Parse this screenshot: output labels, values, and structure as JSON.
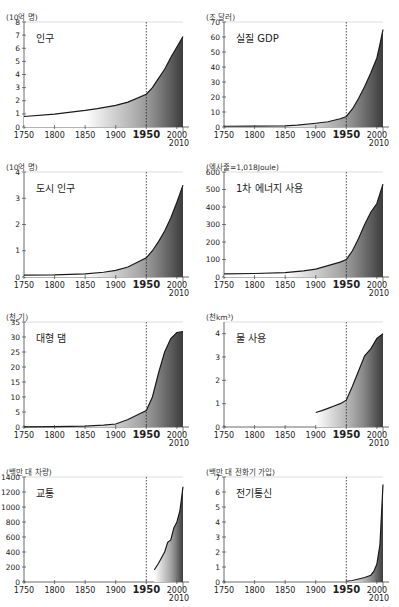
{
  "header_fragment": "",
  "chart_data": [
    {
      "type": "area",
      "title": "인구",
      "ylabel": "(10억 명)",
      "xlabel": "",
      "xlim": [
        1750,
        2010
      ],
      "ylim": [
        0,
        8
      ],
      "yticks": [
        0,
        1,
        2,
        3,
        4,
        5,
        6,
        7,
        8
      ],
      "xticks": [
        "1750",
        "1800",
        "1850",
        "1900",
        "1950",
        "2000"
      ],
      "x_extra_label": "2010",
      "marker_year": 1950,
      "x": [
        1750,
        1800,
        1850,
        1870,
        1900,
        1920,
        1950,
        1960,
        1970,
        1980,
        1990,
        2000,
        2010
      ],
      "values": [
        0.8,
        0.98,
        1.26,
        1.4,
        1.65,
        1.9,
        2.5,
        3.0,
        3.7,
        4.4,
        5.3,
        6.1,
        6.9
      ]
    },
    {
      "type": "area",
      "title": "실질 GDP",
      "ylabel": "(조 달러)",
      "xlabel": "",
      "xlim": [
        1750,
        2010
      ],
      "ylim": [
        0,
        70
      ],
      "yticks": [
        0,
        10,
        20,
        30,
        40,
        50,
        60,
        70
      ],
      "xticks": [
        "1750",
        "1800",
        "1850",
        "1900",
        "1950",
        "2000"
      ],
      "x_extra_label": "2010",
      "marker_year": 1950,
      "x": [
        1750,
        1800,
        1850,
        1870,
        1900,
        1920,
        1940,
        1950,
        1960,
        1970,
        1980,
        1990,
        2000,
        2005,
        2010
      ],
      "values": [
        0.5,
        0.6,
        0.8,
        1.2,
        2.5,
        3.5,
        5.5,
        7,
        12,
        19,
        27,
        36,
        46,
        55,
        65
      ]
    },
    {
      "type": "area",
      "title": "도시 인구",
      "ylabel": "(10억 명)",
      "xlabel": "",
      "xlim": [
        1750,
        2010
      ],
      "ylim": [
        0,
        4
      ],
      "yticks": [
        0,
        1,
        2,
        3,
        4
      ],
      "xticks": [
        "1750",
        "1800",
        "1850",
        "1900",
        "1950",
        "2000"
      ],
      "x_extra_label": "2010",
      "marker_year": 1950,
      "x": [
        1750,
        1800,
        1850,
        1880,
        1900,
        1920,
        1950,
        1960,
        1970,
        1980,
        1990,
        2000,
        2010
      ],
      "values": [
        0.07,
        0.08,
        0.12,
        0.18,
        0.25,
        0.38,
        0.73,
        1.0,
        1.35,
        1.75,
        2.25,
        2.85,
        3.5
      ]
    },
    {
      "type": "area",
      "title": "1차 에너지 사용",
      "ylabel": "(엑사줄=1,018Joule)",
      "xlabel": "",
      "xlim": [
        1750,
        2010
      ],
      "ylim": [
        0,
        600
      ],
      "yticks": [
        0,
        100,
        200,
        300,
        400,
        500,
        600
      ],
      "xticks": [
        "1750",
        "1800",
        "1850",
        "1900",
        "1950",
        "2000"
      ],
      "x_extra_label": "2010",
      "marker_year": 1950,
      "x": [
        1750,
        1800,
        1850,
        1880,
        1900,
        1920,
        1940,
        1950,
        1960,
        1970,
        1980,
        1990,
        2000,
        2010
      ],
      "values": [
        18,
        20,
        25,
        35,
        45,
        65,
        85,
        100,
        150,
        220,
        300,
        370,
        420,
        530
      ]
    },
    {
      "type": "area",
      "title": "대형 댐",
      "ylabel": "(천 기)",
      "xlabel": "",
      "xlim": [
        1750,
        2010
      ],
      "ylim": [
        0,
        35
      ],
      "yticks": [
        0,
        5,
        10,
        15,
        20,
        25,
        30,
        35
      ],
      "xticks": [
        "1750",
        "1800",
        "1850",
        "1900",
        "1950",
        "2000"
      ],
      "x_extra_label": "2010",
      "marker_year": 1950,
      "x": [
        1750,
        1800,
        1850,
        1880,
        1900,
        1920,
        1940,
        1950,
        1960,
        1970,
        1980,
        1990,
        2000,
        2010
      ],
      "values": [
        0.05,
        0.1,
        0.3,
        0.6,
        1,
        2.5,
        4.5,
        5.5,
        10,
        18,
        25,
        29.5,
        31.5,
        31.8
      ]
    },
    {
      "type": "area",
      "title": "물 사용",
      "ylabel": "(천km³)",
      "xlabel": "",
      "xlim": [
        1750,
        2010
      ],
      "ylim": [
        0,
        4.5
      ],
      "yticks": [
        0,
        1,
        2,
        3,
        4
      ],
      "xticks": [
        "1750",
        "1800",
        "1850",
        "1900",
        "1950",
        "2000"
      ],
      "x_extra_label": "2010",
      "marker_year": 1950,
      "x": [
        1900,
        1910,
        1920,
        1930,
        1940,
        1950,
        1960,
        1970,
        1980,
        1990,
        2000,
        2010
      ],
      "values": [
        0.62,
        0.7,
        0.8,
        0.9,
        1.0,
        1.15,
        1.75,
        2.4,
        3.05,
        3.35,
        3.8,
        4.0
      ]
    },
    {
      "type": "area",
      "title": "교통",
      "ylabel": "(백만 대 차량)",
      "xlabel": "",
      "xlim": [
        1750,
        2010
      ],
      "ylim": [
        0,
        1400
      ],
      "yticks": [
        0,
        200,
        400,
        600,
        800,
        1000,
        1200,
        1400
      ],
      "xticks": [
        "1750",
        "1800",
        "1850",
        "1900",
        "1950",
        "2000"
      ],
      "x_extra_label": "2010",
      "marker_year": 1950,
      "x": [
        1963,
        1970,
        1980,
        1985,
        1990,
        1995,
        2000,
        2005,
        2010
      ],
      "values": [
        160,
        250,
        400,
        530,
        560,
        720,
        800,
        950,
        1270
      ]
    },
    {
      "type": "area",
      "title": "전기통신",
      "ylabel": "(백만 대 전화기 가입)",
      "xlabel": "",
      "xlim": [
        1750,
        2010
      ],
      "ylim": [
        0,
        7
      ],
      "yticks": [
        0,
        1,
        2,
        3,
        4,
        5,
        6,
        7
      ],
      "xticks": [
        "1750",
        "1800",
        "1850",
        "1900",
        "1950",
        "2000"
      ],
      "x_extra_label": "2010",
      "marker_year": 1950,
      "x": [
        1950,
        1960,
        1970,
        1980,
        1990,
        1995,
        2000,
        2005,
        2010
      ],
      "values": [
        0.05,
        0.1,
        0.2,
        0.3,
        0.45,
        0.7,
        1.2,
        2.5,
        6.5
      ]
    }
  ]
}
